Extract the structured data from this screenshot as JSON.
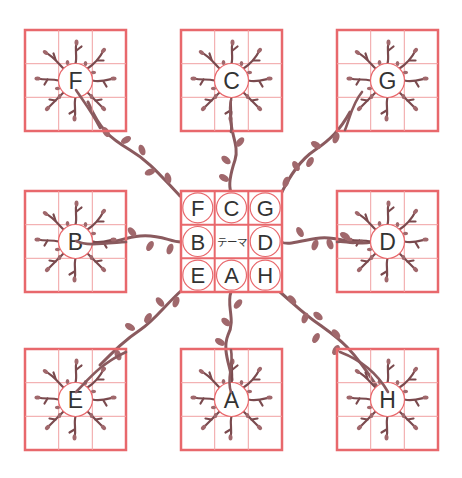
{
  "diagram": {
    "type": "mandala-chart",
    "colors": {
      "grid": "#e8686c",
      "grid_thin": "#f0a0a2",
      "vine": "#8a5a5e",
      "leaf": "#a0686c",
      "text": "#333333",
      "background": "#ffffff"
    },
    "center": {
      "theme_label": "テーマ",
      "cells": [
        "F",
        "C",
        "G",
        "B",
        "テーマ",
        "D",
        "E",
        "A",
        "H"
      ]
    },
    "outer_boxes": [
      {
        "id": "F",
        "label": "F",
        "position": "top-left"
      },
      {
        "id": "C",
        "label": "C",
        "position": "top-center"
      },
      {
        "id": "G",
        "label": "G",
        "position": "top-right"
      },
      {
        "id": "B",
        "label": "B",
        "position": "middle-left"
      },
      {
        "id": "D",
        "label": "D",
        "position": "middle-right"
      },
      {
        "id": "E",
        "label": "E",
        "position": "bottom-left"
      },
      {
        "id": "A",
        "label": "A",
        "position": "bottom-center"
      },
      {
        "id": "H",
        "label": "H",
        "position": "bottom-right"
      }
    ]
  }
}
